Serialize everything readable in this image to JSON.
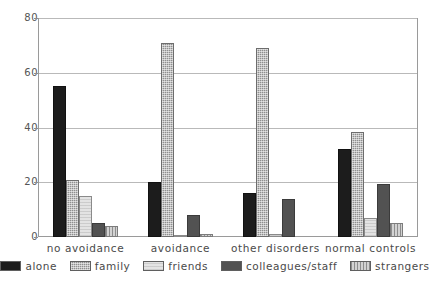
{
  "chart_data": {
    "type": "bar",
    "title": "",
    "subtitle": "",
    "xlabel": "",
    "ylabel": "",
    "ylim": [
      0,
      80
    ],
    "yticks": [
      0,
      20,
      40,
      60,
      80
    ],
    "grid": true,
    "legend_position": "bottom",
    "grouping": "grouped",
    "categories": [
      "no avoidance",
      "avoidance",
      "other disorders",
      "normal controls"
    ],
    "series": [
      {
        "name": "alone",
        "color": "#1c1c1c",
        "pattern": "solid-black",
        "values": [
          55,
          20,
          16,
          32
        ]
      },
      {
        "name": "family",
        "color": "#8f8f8f",
        "pattern": "stipple-gray",
        "values": [
          21,
          71,
          69,
          38.5
        ]
      },
      {
        "name": "friends",
        "color": "#e3e3e3",
        "pattern": "light-gray",
        "values": [
          15,
          0.4,
          1,
          7
        ]
      },
      {
        "name": "colleagues/staff",
        "color": "#525252",
        "pattern": "solid-dark-gray",
        "values": [
          5,
          8,
          14,
          19.5
        ]
      },
      {
        "name": "strangers",
        "color": "#d2d2d2",
        "pattern": "vertical-stripes",
        "values": [
          4,
          1,
          0,
          5
        ]
      }
    ]
  },
  "axis": {
    "y_tick_labels": [
      "0",
      "20",
      "40",
      "60",
      "80"
    ]
  },
  "legend": {
    "items": [
      {
        "label": "alone"
      },
      {
        "label": "family"
      },
      {
        "label": "friends"
      },
      {
        "label": "colleagues/staff"
      },
      {
        "label": "strangers"
      }
    ]
  }
}
